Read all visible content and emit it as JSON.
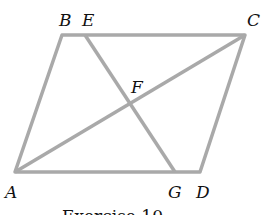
{
  "figure": {
    "caption": "Exercise 10",
    "line_color": "#a9a9a9",
    "points": {
      "A": {
        "label": "A",
        "x": 15,
        "y": 172
      },
      "B": {
        "label": "B",
        "x": 62,
        "y": 35
      },
      "C": {
        "label": "C",
        "x": 245,
        "y": 35
      },
      "D": {
        "label": "D",
        "x": 200,
        "y": 172
      },
      "E": {
        "label": "E",
        "x": 85,
        "y": 35
      },
      "F": {
        "label": "F",
        "x": 128,
        "y": 104
      },
      "G": {
        "label": "G",
        "x": 175,
        "y": 172
      }
    },
    "segments": [
      "AB",
      "BC",
      "CD",
      "DA",
      "AC",
      "EG"
    ]
  }
}
